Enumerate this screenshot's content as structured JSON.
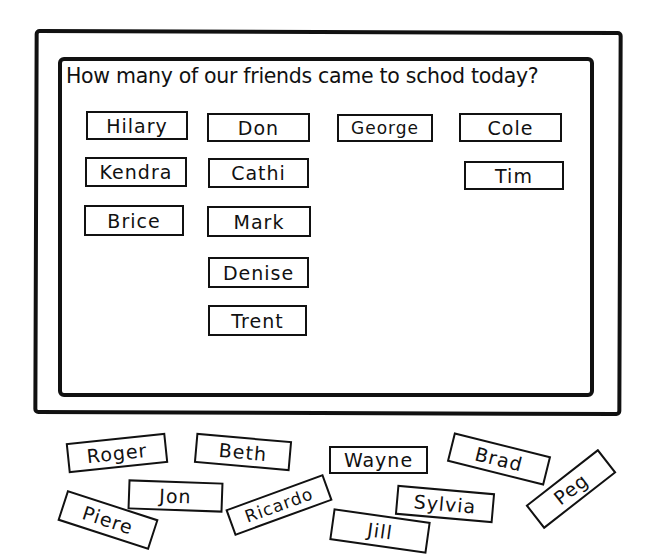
{
  "board": {
    "question": "How many of our friends came to schod today?",
    "present_cards": [
      {
        "name": "Hilary"
      },
      {
        "name": "Don"
      },
      {
        "name": "George"
      },
      {
        "name": "Cole"
      },
      {
        "name": "Kendra"
      },
      {
        "name": "Cathi"
      },
      {
        "name": "Tim"
      },
      {
        "name": "Brice"
      },
      {
        "name": "Mark"
      },
      {
        "name": "Denise"
      },
      {
        "name": "Trent"
      }
    ]
  },
  "loose_cards": [
    {
      "name": "Roger"
    },
    {
      "name": "Beth"
    },
    {
      "name": "Wayne"
    },
    {
      "name": "Brad"
    },
    {
      "name": "Jon"
    },
    {
      "name": "Sylvia"
    },
    {
      "name": "Peg"
    },
    {
      "name": "Piere"
    },
    {
      "name": "Ricardo"
    },
    {
      "name": "Jill"
    }
  ],
  "colors": {
    "ink": "#111111",
    "paper": "#ffffff"
  }
}
